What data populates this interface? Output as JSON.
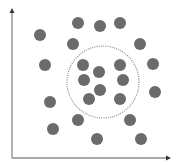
{
  "diagram": {
    "colors": {
      "background": "#ffffff",
      "axis": "#8a8a8a",
      "dot": "#6b6b6b",
      "circle": "#8c8c8c"
    },
    "axes": {
      "origin": [
        12,
        158
      ],
      "y_top": [
        12,
        8
      ],
      "x_right": [
        171,
        158
      ],
      "x_label": "",
      "y_label": ""
    },
    "circle": {
      "cx": 103,
      "cy": 82,
      "r": 36,
      "style": "dotted"
    },
    "dot_radius": 6,
    "dots_inside": [
      [
        83,
        65
      ],
      [
        120,
        65
      ],
      [
        99,
        72
      ],
      [
        84,
        80
      ],
      [
        123,
        80
      ],
      [
        100,
        90
      ],
      [
        89,
        99
      ],
      [
        120,
        99
      ]
    ],
    "dots_outside": [
      [
        40,
        35
      ],
      [
        78,
        23
      ],
      [
        100,
        26
      ],
      [
        120,
        23
      ],
      [
        73,
        44
      ],
      [
        140,
        44
      ],
      [
        45,
        65
      ],
      [
        153,
        64
      ],
      [
        155,
        92
      ],
      [
        50,
        102
      ],
      [
        78,
        120
      ],
      [
        130,
        120
      ],
      [
        53,
        129
      ],
      [
        97,
        139
      ],
      [
        141,
        139
      ]
    ]
  }
}
